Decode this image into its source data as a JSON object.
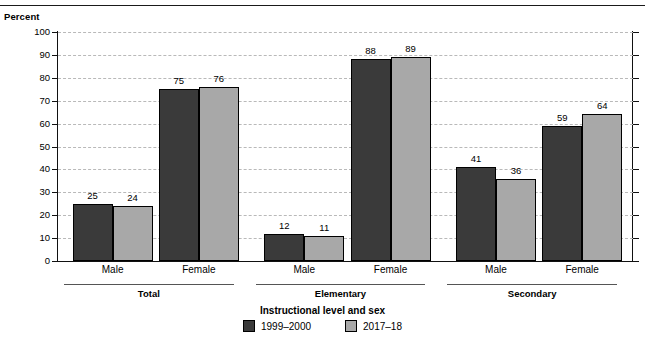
{
  "axis_title": "Percent",
  "x_title": "Instructional level and sex",
  "legend": [
    {
      "label": "1999–2000",
      "color": "#3a3a3a",
      "swatch": "series-1-swatch"
    },
    {
      "label": "2017–18",
      "color": "#a8a8a8",
      "swatch": "series-2-swatch"
    }
  ],
  "groups": [
    {
      "name": "Total",
      "categories": [
        "Male",
        "Female"
      ]
    },
    {
      "name": "Elementary",
      "categories": [
        "Male",
        "Female"
      ]
    },
    {
      "name": "Secondary",
      "categories": [
        "Male",
        "Female"
      ]
    }
  ],
  "chart_data": {
    "type": "bar",
    "title": "",
    "xlabel": "Instructional level and sex",
    "ylabel": "Percent",
    "ylim": [
      0,
      100
    ],
    "yticks": [
      0,
      10,
      20,
      30,
      40,
      50,
      60,
      70,
      80,
      90,
      100
    ],
    "grid": true,
    "legend_position": "bottom",
    "categories": [
      "Total: Male",
      "Total: Female",
      "Elementary: Male",
      "Elementary: Female",
      "Secondary: Male",
      "Secondary: Female"
    ],
    "series": [
      {
        "name": "1999–2000",
        "color": "#3a3a3a",
        "values": [
          25,
          75,
          12,
          88,
          41,
          59
        ]
      },
      {
        "name": "2017–18",
        "color": "#a8a8a8",
        "values": [
          24,
          76,
          11,
          89,
          36,
          64
        ]
      }
    ]
  }
}
